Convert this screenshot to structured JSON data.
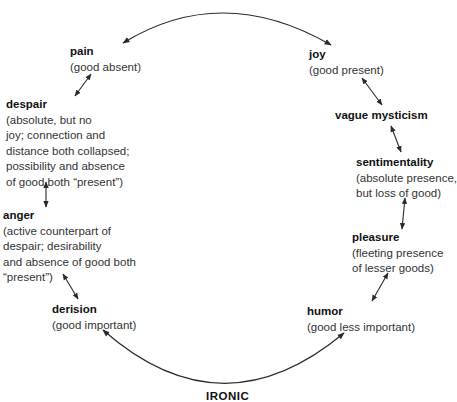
{
  "diagram": {
    "left_column": [
      {
        "id": "pain",
        "term": "pain",
        "desc_lines": [
          "(good absent)"
        ]
      },
      {
        "id": "despair",
        "term": "despair",
        "desc_lines": [
          "(absolute, but no",
          "joy; connection and",
          "distance both collapsed;",
          "possibility and absence",
          "of good both “present”)"
        ]
      },
      {
        "id": "anger",
        "term": "anger",
        "desc_lines": [
          "(active counterpart of",
          "despair; desirability",
          "and absence of good both",
          "“present”)"
        ]
      },
      {
        "id": "derision",
        "term": "derision",
        "desc_lines": [
          "(good important)"
        ]
      }
    ],
    "right_column": [
      {
        "id": "joy",
        "term": "joy",
        "desc_lines": [
          "(good present)"
        ]
      },
      {
        "id": "vague_mysticism",
        "term": "vague mysticism",
        "desc_lines": []
      },
      {
        "id": "sentimentality",
        "term": "sentimentality",
        "desc_lines": [
          "(absolute presence,",
          "but loss of good)"
        ]
      },
      {
        "id": "pleasure",
        "term": "pleasure",
        "desc_lines": [
          "(fleeting presence",
          "of lesser goods)"
        ]
      },
      {
        "id": "humor",
        "term": "humor",
        "desc_lines": [
          "(good less important)"
        ]
      }
    ],
    "footer_label": "IRONIC",
    "colors": {
      "line": "#2a2a2a",
      "text": "#222222",
      "background": "#ffffff"
    }
  }
}
